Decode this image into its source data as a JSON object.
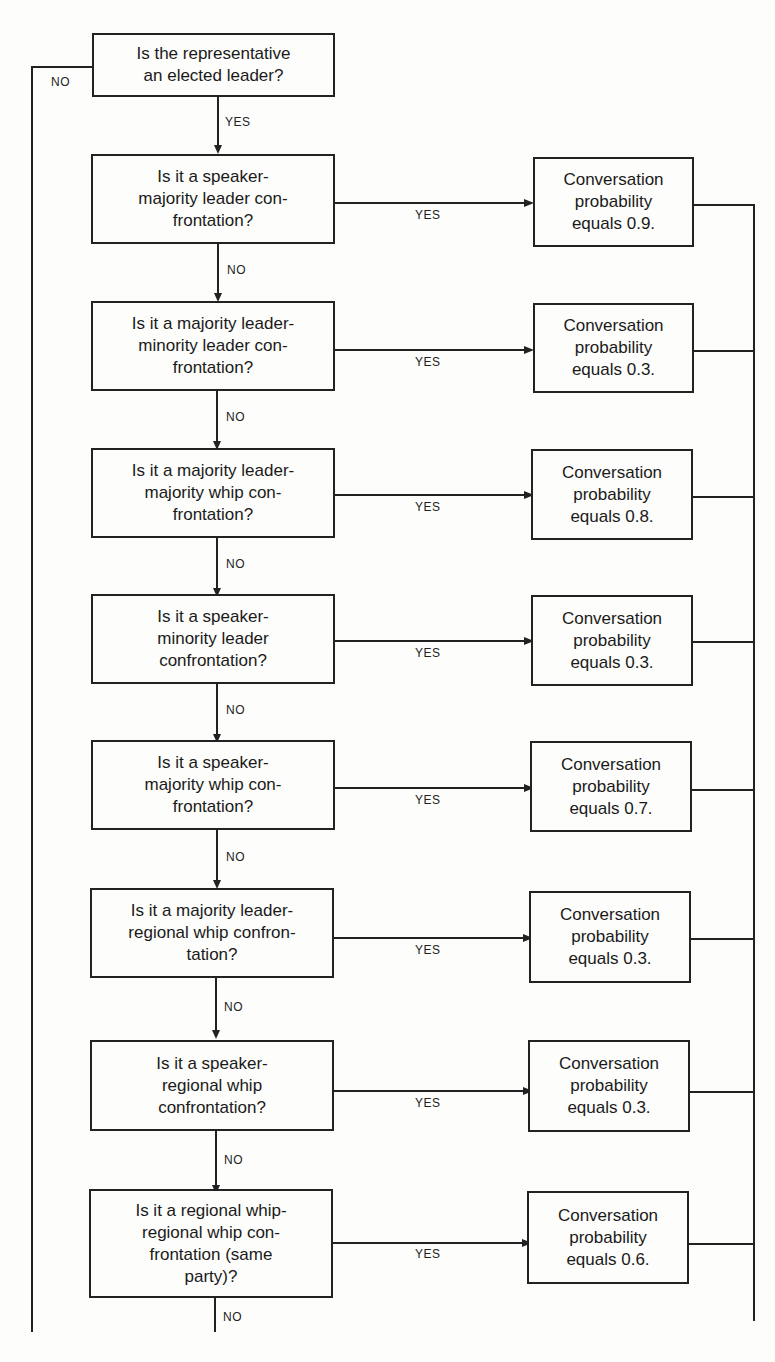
{
  "labels": {
    "yes": "YES",
    "no": "NO"
  },
  "start": {
    "lines": [
      "Is the representative",
      "an elected leader?"
    ]
  },
  "decisions": [
    {
      "lines": [
        "Is it a speaker-",
        "majority leader con-",
        "frontation?"
      ],
      "outcome": [
        "Conversation",
        "probability",
        "equals 0.9."
      ],
      "probability": 0.9
    },
    {
      "lines": [
        "Is it a majority leader-",
        "minority leader con-",
        "frontation?"
      ],
      "outcome": [
        "Conversation",
        "probability",
        "equals 0.3."
      ],
      "probability": 0.3
    },
    {
      "lines": [
        "Is it a majority leader-",
        "majority whip con-",
        "frontation?"
      ],
      "outcome": [
        "Conversation",
        "probability",
        "equals 0.8."
      ],
      "probability": 0.8
    },
    {
      "lines": [
        "Is it a speaker-",
        "minority leader",
        "confrontation?"
      ],
      "outcome": [
        "Conversation",
        "probability",
        "equals 0.3."
      ],
      "probability": 0.3
    },
    {
      "lines": [
        "Is it a speaker-",
        "majority whip con-",
        "frontation?"
      ],
      "outcome": [
        "Conversation",
        "probability",
        "equals 0.7."
      ],
      "probability": 0.7
    },
    {
      "lines": [
        "Is it a majority leader-",
        "regional whip confron-",
        "tation?"
      ],
      "outcome": [
        "Conversation",
        "probability",
        "equals 0.3."
      ],
      "probability": 0.3
    },
    {
      "lines": [
        "Is it a speaker-",
        "regional whip",
        "confrontation?"
      ],
      "outcome": [
        "Conversation",
        "probability",
        "equals 0.3."
      ],
      "probability": 0.3
    },
    {
      "lines": [
        "Is it a regional whip-",
        "regional whip con-",
        "frontation (same",
        "party)?"
      ],
      "outcome": [
        "Conversation",
        "probability",
        "equals 0.6."
      ],
      "probability": 0.6
    }
  ],
  "colors": {
    "line": "#222222",
    "background": "#fdfdfb"
  }
}
